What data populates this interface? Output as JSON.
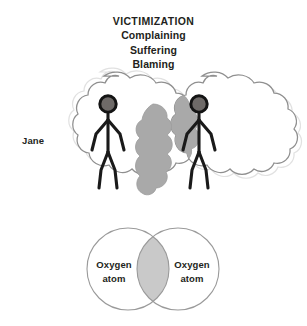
{
  "figure": {
    "title": {
      "heading": "VICTIMIZATION",
      "lines": [
        "Complaining",
        "Suffering",
        "Blaming"
      ]
    },
    "people": {
      "left_label": "Jane",
      "right_label": "Joan",
      "left_figure_name": "stick-figure-jane",
      "right_figure_name": "stick-figure-joan"
    },
    "clouds": {
      "left_name": "thought-cloud-jane",
      "right_name": "thought-cloud-joan",
      "overlap_name": "shared-overlap-region",
      "fill": "#ffffff",
      "stroke": "#9a9a9a",
      "overlap_fill": "#a9a9a9"
    },
    "venn": {
      "left_label_line1": "Oxygen",
      "left_label_line2": "atom",
      "right_label_line1": "Oxygen",
      "right_label_line2": "atom",
      "circle_stroke": "#9a9a9a",
      "circle_fill": "#ffffff",
      "intersection_fill": "#c9c9c9"
    },
    "colors": {
      "background": "#ffffff",
      "ink": "#231f20",
      "figure_stroke": "#1a1a1a",
      "head_fill": "#6e6a68",
      "gray_mid": "#a9a9a9",
      "gray_light": "#c9c9c9",
      "outline_gray": "#9a9a9a"
    }
  }
}
